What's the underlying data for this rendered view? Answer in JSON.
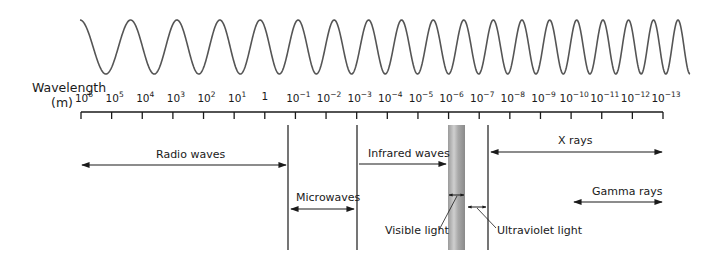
{
  "axis": {
    "title_line1": "Wavelength",
    "title_line2": "(m)",
    "x_start": 81,
    "x_end": 663,
    "ticks": [
      {
        "base": "10",
        "exp": "6"
      },
      {
        "base": "10",
        "exp": "5"
      },
      {
        "base": "10",
        "exp": "4"
      },
      {
        "base": "10",
        "exp": "3"
      },
      {
        "base": "10",
        "exp": "2"
      },
      {
        "base": "10",
        "exp": "1"
      },
      {
        "base": "1",
        "exp": ""
      },
      {
        "base": "10",
        "exp": "−1"
      },
      {
        "base": "10",
        "exp": "−2"
      },
      {
        "base": "10",
        "exp": "−3"
      },
      {
        "base": "10",
        "exp": "−4"
      },
      {
        "base": "10",
        "exp": "−5"
      },
      {
        "base": "10",
        "exp": "−6"
      },
      {
        "base": "10",
        "exp": "−7"
      },
      {
        "base": "10",
        "exp": "−8"
      },
      {
        "base": "10",
        "exp": "−9"
      },
      {
        "base": "10",
        "exp": "−10"
      },
      {
        "base": "10",
        "exp": "−11"
      },
      {
        "base": "10",
        "exp": "−12"
      },
      {
        "base": "10",
        "exp": "−13"
      }
    ]
  },
  "bands": {
    "radio": {
      "label": "Radio waves"
    },
    "microwaves": {
      "label": "Microwaves"
    },
    "infrared": {
      "label": "Infrared waves"
    },
    "visible": {
      "label": "Visible light"
    },
    "ultraviolet": {
      "label": "Ultraviolet light"
    },
    "xrays": {
      "label": "X rays"
    },
    "gamma": {
      "label": "Gamma rays"
    }
  },
  "colors": {
    "line": "#1a1a1a",
    "wave": "#555555",
    "visible_bar_dark": "#8c8c8c",
    "visible_bar_light": "#c8c8c8"
  }
}
